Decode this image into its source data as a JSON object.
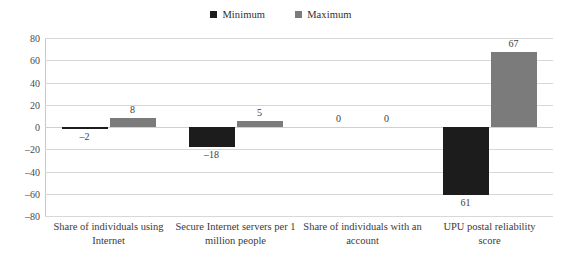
{
  "chart_data": {
    "type": "bar",
    "title": "",
    "subtitle": "",
    "xlabel": "",
    "ylabel": "",
    "ylim": [
      -80,
      80
    ],
    "yticks": [
      80,
      60,
      40,
      20,
      0,
      -20,
      -40,
      -60,
      -80
    ],
    "ytick_labels": [
      "80",
      "60",
      "40",
      "20",
      "0",
      "–20",
      "–40",
      "–60",
      "–80"
    ],
    "grid": "horizontal",
    "legend_position": "top-center",
    "categories": [
      "Share of individuals using Internet",
      "Secure Internet servers per 1 million people",
      "Share of individuals with an account",
      "UPU postal reliability score"
    ],
    "series": [
      {
        "name": "Minimum",
        "color": "#1c1c1c",
        "values": [
          -2,
          -18,
          0,
          -61
        ],
        "labels": [
          "–2",
          "–18",
          "0",
          "61"
        ]
      },
      {
        "name": "Maximum",
        "color": "#7b7b7b",
        "values": [
          8,
          5,
          0,
          67
        ],
        "labels": [
          "8",
          "5",
          "0",
          "67"
        ]
      }
    ]
  },
  "legend": {
    "entries": [
      {
        "label": "Minimum",
        "color": "#1c1c1c"
      },
      {
        "label": "Maximum",
        "color": "#7b7b7b"
      }
    ]
  },
  "axis": {
    "y_labels": [
      "80",
      "60",
      "40",
      "20",
      "0",
      "–20",
      "–40",
      "–60",
      "–80"
    ]
  },
  "categories": [
    {
      "line1": "Share of individuals using",
      "line2": "Internet"
    },
    {
      "line1": "Secure Internet servers per 1",
      "line2": "million people"
    },
    {
      "line1": "Share of individuals with an",
      "line2": "account"
    },
    {
      "line1": "UPU postal reliability",
      "line2": "score"
    }
  ]
}
